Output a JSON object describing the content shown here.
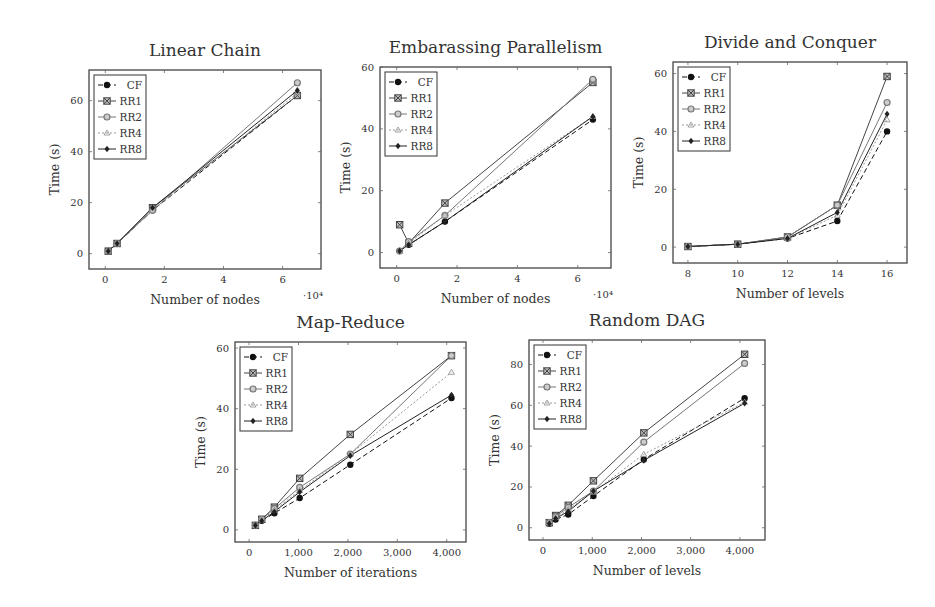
{
  "figure": {
    "series_names": [
      "CF",
      "RR1",
      "RR2",
      "RR4",
      "RR8"
    ],
    "series_styles": {
      "CF": {
        "color": "#111111",
        "dash": "5,3",
        "marker": "circle"
      },
      "RR1": {
        "color": "#444444",
        "dash": "",
        "marker": "square-x"
      },
      "RR2": {
        "color": "#777777",
        "dash": "",
        "marker": "circle-o"
      },
      "RR4": {
        "color": "#999999",
        "dash": "2,2",
        "marker": "tri"
      },
      "RR8": {
        "color": "#222222",
        "dash": "",
        "marker": "diamond"
      }
    }
  },
  "chart_data": [
    {
      "id": "linear-chain",
      "type": "line",
      "title": "Linear Chain",
      "xlabel": "Number of nodes",
      "ylabel": "Time (s)",
      "x_multiplier_label": "·10⁴",
      "x": [
        0.1,
        0.4,
        1.6,
        6.5
      ],
      "xticks": [
        0,
        2,
        4,
        6
      ],
      "xtick_labels": [
        "0",
        "2",
        "4",
        "6"
      ],
      "yticks": [
        0,
        20,
        40,
        60
      ],
      "xlim": [
        -0.55,
        7.3
      ],
      "ylim": [
        -6,
        72
      ],
      "grid": false,
      "legend_position": "upper left",
      "series": [
        {
          "name": "CF",
          "values": [
            1,
            4,
            17,
            62
          ]
        },
        {
          "name": "RR1",
          "values": [
            1,
            4,
            18,
            62
          ]
        },
        {
          "name": "RR2",
          "values": [
            1,
            4,
            17,
            67
          ]
        },
        {
          "name": "RR4",
          "values": [
            1,
            4,
            17,
            63
          ]
        },
        {
          "name": "RR8",
          "values": [
            1,
            4,
            18,
            64
          ]
        }
      ],
      "box": {
        "left": 89,
        "top": 70,
        "width": 232,
        "height": 199
      }
    },
    {
      "id": "embarassing-parallelism",
      "type": "line",
      "title": "Embarassing Parallelism",
      "xlabel": "Number of nodes",
      "ylabel": "Time (s)",
      "x_multiplier_label": "·10⁴",
      "x": [
        0.1,
        0.4,
        1.6,
        6.5
      ],
      "xticks": [
        0,
        2,
        4,
        6
      ],
      "xtick_labels": [
        "0",
        "2",
        "4",
        "6"
      ],
      "yticks": [
        0,
        20,
        40,
        60
      ],
      "xlim": [
        -0.55,
        7.1
      ],
      "ylim": [
        -5,
        60
      ],
      "grid": false,
      "legend_position": "upper left",
      "series": [
        {
          "name": "CF",
          "values": [
            0.5,
            2.5,
            10,
            43
          ]
        },
        {
          "name": "RR1",
          "values": [
            9,
            3,
            16,
            55
          ]
        },
        {
          "name": "RR2",
          "values": [
            0.5,
            3.5,
            12,
            56
          ]
        },
        {
          "name": "RR4",
          "values": [
            0.5,
            3,
            12,
            44
          ]
        },
        {
          "name": "RR8",
          "values": [
            0.5,
            2.5,
            10,
            44
          ]
        }
      ],
      "box": {
        "left": 380,
        "top": 67,
        "width": 231,
        "height": 201
      }
    },
    {
      "id": "divide-and-conquer",
      "type": "line",
      "title": "Divide and Conquer",
      "xlabel": "Number of levels",
      "ylabel": "Time (s)",
      "x_multiplier_label": "",
      "x": [
        8,
        10,
        12,
        14,
        16
      ],
      "xticks": [
        8,
        10,
        12,
        14,
        16
      ],
      "xtick_labels": [
        "8",
        "10",
        "12",
        "14",
        "16"
      ],
      "yticks": [
        0,
        20,
        40,
        60
      ],
      "xlim": [
        7.4,
        16.8
      ],
      "ylim": [
        -5.5,
        64
      ],
      "grid": false,
      "legend_position": "upper left",
      "series": [
        {
          "name": "CF",
          "values": [
            0.2,
            1,
            3,
            9,
            40
          ]
        },
        {
          "name": "RR1",
          "values": [
            0.2,
            1,
            3.5,
            14.5,
            59
          ]
        },
        {
          "name": "RR2",
          "values": [
            0.2,
            1,
            3.5,
            14.5,
            50
          ]
        },
        {
          "name": "RR4",
          "values": [
            0.2,
            1,
            3,
            11,
            44
          ]
        },
        {
          "name": "RR8",
          "values": [
            0.2,
            1,
            3,
            12,
            46
          ]
        }
      ],
      "box": {
        "left": 673,
        "top": 62,
        "width": 234,
        "height": 201
      }
    },
    {
      "id": "map-reduce",
      "type": "line",
      "title": "Map-Reduce",
      "xlabel": "Number of iterations",
      "ylabel": "Time (s)",
      "x_multiplier_label": "",
      "x": [
        128,
        256,
        512,
        1024,
        2048,
        4096
      ],
      "xticks": [
        0,
        1000,
        2000,
        3000,
        4000
      ],
      "xtick_labels": [
        "0",
        "1,000",
        "2,000",
        "3,000",
        "4,000"
      ],
      "yticks": [
        0,
        20,
        40,
        60
      ],
      "xlim": [
        -285,
        4390
      ],
      "ylim": [
        -4,
        62
      ],
      "grid": false,
      "legend_position": "upper left",
      "series": [
        {
          "name": "CF",
          "values": [
            1.5,
            3,
            5.5,
            10.5,
            21.5,
            43.5
          ]
        },
        {
          "name": "RR1",
          "values": [
            1.5,
            3.5,
            7.5,
            17,
            31.5,
            57.5
          ]
        },
        {
          "name": "RR2",
          "values": [
            1.5,
            3.5,
            7,
            14,
            25,
            57.5
          ]
        },
        {
          "name": "RR4",
          "values": [
            1.5,
            3.5,
            6.5,
            13,
            25,
            52
          ]
        },
        {
          "name": "RR8",
          "values": [
            1.5,
            3,
            6,
            12.5,
            24.5,
            44.5
          ]
        }
      ],
      "box": {
        "left": 235,
        "top": 342,
        "width": 231,
        "height": 200
      }
    },
    {
      "id": "random-dag",
      "type": "line",
      "title": "Random DAG",
      "xlabel": "Number of levels",
      "ylabel": "Time (s)",
      "x_multiplier_label": "",
      "x": [
        128,
        256,
        512,
        1024,
        2048,
        4096
      ],
      "xticks": [
        0,
        1000,
        2000,
        3000,
        4000
      ],
      "xtick_labels": [
        "0",
        "1,000",
        "2,000",
        "3,000",
        "4,000"
      ],
      "yticks": [
        0,
        20,
        40,
        60,
        80
      ],
      "xlim": [
        -285,
        4510
      ],
      "ylim": [
        -6,
        92
      ],
      "grid": false,
      "legend_position": "upper left",
      "series": [
        {
          "name": "CF",
          "values": [
            2,
            4,
            6.5,
            15.5,
            33.5,
            63.5
          ]
        },
        {
          "name": "RR1",
          "values": [
            2.5,
            6,
            11,
            23,
            46.5,
            85
          ]
        },
        {
          "name": "RR2",
          "values": [
            2.5,
            5.5,
            10,
            18,
            42,
            80.5
          ]
        },
        {
          "name": "RR4",
          "values": [
            2.5,
            5,
            9,
            17.5,
            36,
            61.5
          ]
        },
        {
          "name": "RR8",
          "values": [
            2,
            4.5,
            8,
            18,
            33,
            61
          ]
        }
      ],
      "box": {
        "left": 529,
        "top": 340,
        "width": 236,
        "height": 200
      }
    }
  ]
}
